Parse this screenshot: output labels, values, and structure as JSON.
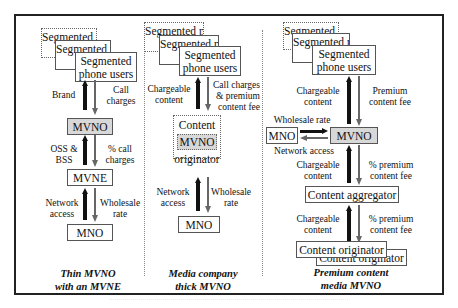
{
  "columns": [
    {
      "stack_label": "Segmented phone users",
      "stack_fragments": [
        "Segmented",
        "phone users"
      ],
      "arrow_up_label": "Brand",
      "arrow_down_label": "Call charges",
      "nodes": [
        "MVNO",
        "MVNE",
        "MNO"
      ],
      "link2_up": "OSS & BSS",
      "link2_down": "% call charges",
      "link3_up": "Network access",
      "link3_down": "Wholesale rate",
      "caption_line1": "Thin MVNO",
      "caption_line2": "with an MVNE"
    },
    {
      "stack_label": "Segmented phone users",
      "arrow_up_label": "Chargeable content",
      "arrow_down_label": "Call charges & premium content fee",
      "content_top": "Content",
      "content_mid": "MVNO",
      "content_bottom": "originator",
      "link2_up": "Network access",
      "link2_down": "Wholesale rate",
      "mno": "MNO",
      "caption_line1": "Media company",
      "caption_line2": "thick MVNO"
    },
    {
      "stack_label": "Segmented phone users",
      "arrow_up_label": "Chargeable content",
      "arrow_down_label": "Premium content fee",
      "mno": "MNO",
      "mvno": "MVNO",
      "wholesale_label": "Wholesale rate",
      "network_label": "Network access",
      "link2_up": "Chargeable content",
      "link2_down": "% premium content fee",
      "aggregator": "Content aggregator",
      "link3_up": "Chargeable content",
      "link3_down": "% premium content fee",
      "originator": "Content originator",
      "caption_line1": "Premium content",
      "caption_line2": "media MVNO"
    }
  ],
  "colors": {
    "shaded_node": "#d8d8d8",
    "arrow_up": "#111111",
    "arrow_down": "#666666",
    "frame": "#222222"
  }
}
